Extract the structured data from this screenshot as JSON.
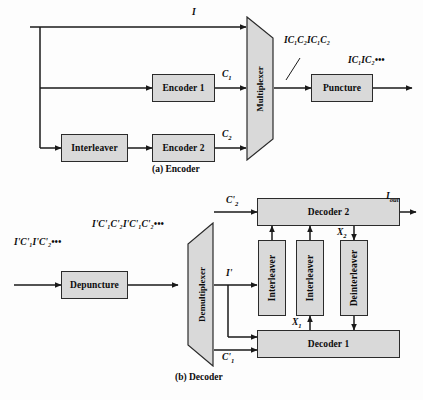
{
  "figure": {
    "encoder_caption": "(a) Encoder",
    "decoder_caption": "(b) Decoder"
  },
  "encoder": {
    "blocks": [
      {
        "name": "encoder-1",
        "label": "Encoder 1"
      },
      {
        "name": "encoder-2",
        "label": "Encoder 2"
      },
      {
        "name": "interleaver",
        "label": "Interleaver"
      },
      {
        "name": "multiplexer",
        "label": "Multiplexer"
      },
      {
        "name": "puncture",
        "label": "Puncture"
      }
    ],
    "signals": {
      "input": "I",
      "enc1_out": "C",
      "enc1_out_sub": "1",
      "enc2_out": "C",
      "enc2_out_sub": "2",
      "mux_out": "IC₁C₂IC₁C₂",
      "puncture_out": "IC₁IC₂•••"
    }
  },
  "decoder": {
    "blocks": [
      {
        "name": "depuncture",
        "label": "Depuncture"
      },
      {
        "name": "demultiplexer",
        "label": "Demultiplexer"
      },
      {
        "name": "decoder-2",
        "label": "Decoder 2"
      },
      {
        "name": "decoder-1",
        "label": "Decoder 1"
      },
      {
        "name": "interleaver-left",
        "label": "Interleaver"
      },
      {
        "name": "interleaver-middle",
        "label": "Interleaver"
      },
      {
        "name": "deinterleaver",
        "label": "Deinterleaver"
      }
    ],
    "signals": {
      "depuncture_in": "I'C'₁I'C'₂•••",
      "demux_in": "I'C'₁C'₂I'C'₁C'₂•••",
      "demux_out_top": "C'",
      "demux_out_top_sub": "2",
      "demux_out_mid": "I'",
      "demux_out_bottom": "C'",
      "demux_out_bottom_sub": "1",
      "feedback_x1": "X",
      "feedback_x1_sub": "1",
      "feedback_x2": "X",
      "feedback_x2_sub": "2",
      "output": "I",
      "output_sub": "out"
    }
  },
  "colors": {
    "block_fill": "#d9d9d9",
    "stroke": "#2b2b2b",
    "text": "#0c0c0c",
    "background": "#fdfdfd"
  }
}
